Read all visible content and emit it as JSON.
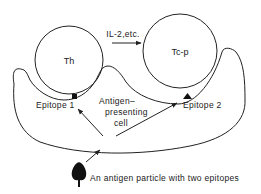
{
  "diagram": {
    "cells": {
      "th": {
        "label": "Th"
      },
      "tcp": {
        "label": "Tc-p"
      },
      "apc": {
        "label_lines": [
          "Antigen–",
          "presenting",
          "cell"
        ]
      }
    },
    "signal": {
      "label": "IL-2,etc."
    },
    "epitopes": [
      {
        "label": "Epitope 1",
        "marker": "square"
      },
      {
        "label": "Epitope 2",
        "marker": "triangle"
      }
    ],
    "antigen": {
      "caption": "An antigen particle with two epitopes"
    },
    "colors": {
      "line": "#222222",
      "background": "#ffffff"
    }
  }
}
